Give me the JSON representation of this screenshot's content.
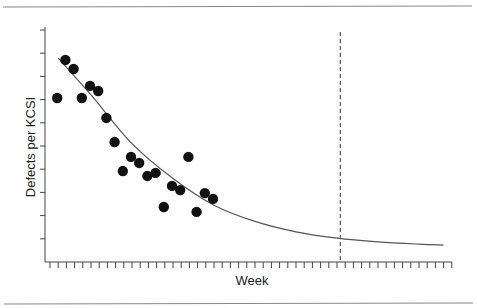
{
  "chart_data": {
    "type": "scatter",
    "title": "",
    "xlabel": "Week",
    "ylabel": "Defects per KCSI",
    "xlim": [
      0,
      49
    ],
    "ylim": [
      0,
      10
    ],
    "x_tick_count": 50,
    "y_tick_count": 10,
    "tick_labels_shown": false,
    "grid": false,
    "legend": null,
    "series": [
      {
        "name": "Observed defects",
        "kind": "scatter",
        "marker": "filled-circle",
        "color": "#111111",
        "x": [
          1,
          2,
          3,
          4,
          5,
          6,
          7,
          8,
          9,
          10,
          11,
          12,
          13,
          14,
          15,
          16,
          17,
          18,
          19,
          20
        ],
        "y": [
          7.07,
          8.71,
          8.32,
          7.07,
          7.59,
          7.37,
          6.21,
          5.17,
          3.92,
          4.53,
          4.27,
          3.71,
          3.84,
          2.37,
          3.28,
          3.1,
          4.53,
          2.16,
          2.97,
          2.72
        ]
      },
      {
        "name": "Fitted decay curve",
        "kind": "line",
        "color": "#555555",
        "x": [
          1,
          5,
          10,
          15,
          20,
          25,
          30,
          35,
          40,
          45,
          48
        ],
        "y": [
          8.79,
          7.2,
          5.1,
          3.6,
          2.45,
          1.75,
          1.3,
          1.03,
          0.87,
          0.77,
          0.73
        ]
      }
    ],
    "annotations": [
      {
        "type": "vertical-dashed-line",
        "x": 35.4,
        "color": "#333333"
      }
    ]
  },
  "labels": {
    "x_axis": "Week",
    "y_axis": "Defects per KCSI"
  }
}
